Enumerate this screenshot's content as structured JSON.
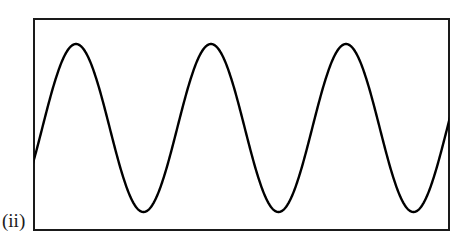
{
  "figure": {
    "label": "(ii)",
    "background_color": "#ffffff",
    "line_color": "#000000",
    "frame_color": "#1a1a1a",
    "frame_stroke_width": 2,
    "wave_stroke_width": 2.4,
    "frame": {
      "x": 33,
      "y": 18,
      "width": 417,
      "height": 213
    }
  },
  "chart_data": {
    "type": "line",
    "title": "",
    "subtitle": "",
    "xlabel": "",
    "ylabel": "",
    "annotations": [
      "(ii)"
    ],
    "legend": [],
    "legend_position": "none",
    "grid": false,
    "axis_ticks": [],
    "xlim": [
      33,
      450
    ],
    "ylim": [
      212,
      44
    ],
    "waveform": {
      "shape": "sine",
      "cycles_visible": 3.1,
      "period_px": 135,
      "amplitude_px": 84,
      "center_y_px": 128,
      "peak_y_px": 44,
      "trough_y_px": 212,
      "phase_start_y_px": 145,
      "phase_end_y_px": 115,
      "peaks_x_px": [
        76,
        208,
        345
      ],
      "troughs_x_px": [
        143,
        277,
        412
      ],
      "start_point": {
        "x": 33,
        "y": 145
      },
      "end_point": {
        "x": 450,
        "y": 115
      }
    },
    "series": [
      {
        "name": "waveform",
        "x": [
          33,
          40,
          50,
          60,
          70,
          76,
          85,
          95,
          105,
          115,
          125,
          135,
          143,
          152,
          162,
          172,
          182,
          192,
          200,
          208,
          218,
          228,
          238,
          248,
          258,
          268,
          277,
          286,
          296,
          306,
          316,
          326,
          336,
          345,
          355,
          365,
          375,
          385,
          395,
          405,
          412,
          422,
          432,
          442,
          450
        ],
        "y": [
          145,
          118,
          85,
          58,
          45,
          44,
          52,
          76,
          110,
          147,
          180,
          203,
          212,
          209,
          194,
          166,
          131,
          94,
          66,
          45,
          45,
          62,
          91,
          126,
          161,
          192,
          212,
          211,
          199,
          174,
          141,
          104,
          70,
          45,
          44,
          57,
          83,
          117,
          154,
          188,
          212,
          205,
          181,
          146,
          115
        ]
      }
    ]
  }
}
